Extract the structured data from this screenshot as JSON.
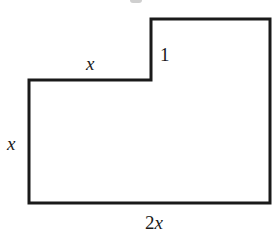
{
  "diagram": {
    "type": "l-shaped-polygon",
    "stroke_color": "#1a1a1a",
    "background": "#ffffff",
    "vertices": [
      [
        29,
        80
      ],
      [
        151,
        80
      ],
      [
        151,
        19
      ],
      [
        270,
        19
      ],
      [
        270,
        203
      ],
      [
        29,
        203
      ]
    ],
    "labels": {
      "top_left_edge": "x",
      "step_height": "1",
      "left_edge": "x",
      "bottom_edge_coefficient": "2",
      "bottom_edge_variable": "x"
    }
  }
}
